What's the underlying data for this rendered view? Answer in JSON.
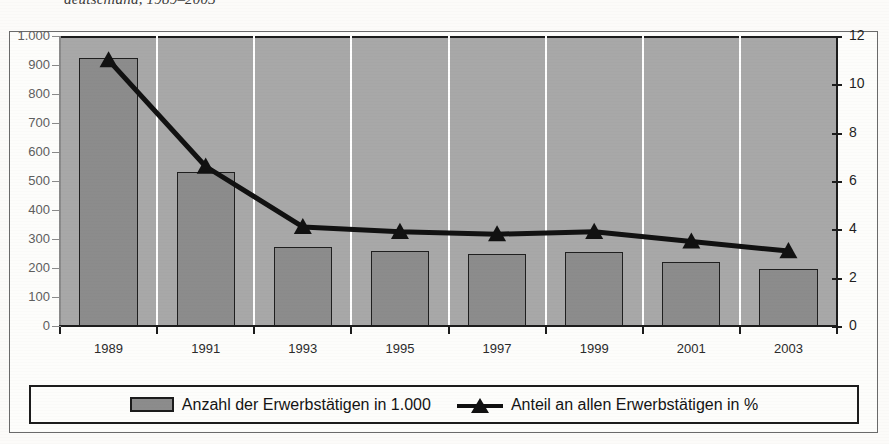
{
  "title": "deutschland, 1989–2003",
  "legend": {
    "bar_label": "Anzahl der Erwerbstätigen in 1.000",
    "bar_swatch_icon": "gray-bar-swatch",
    "line_label": "Anteil an allen Erwerbstätigen in %",
    "line_marker_icon": "triangle-marker-line"
  },
  "colors": {
    "plot_background": "#a8a8a8",
    "gridline": "#ffffff",
    "bar_fill": "#8c8c8c",
    "bar_border": "#1f1f1f",
    "line": "#111111",
    "axis": "#1c1c1c",
    "page_background": "#fcfbf9"
  },
  "chart_data": {
    "type": "bar",
    "title": "deutschland, 1989–2003",
    "subtitle": "",
    "xlabel": "",
    "ylabel": "",
    "grid": "vertical-white",
    "legend_position": "bottom",
    "categories": [
      "1989",
      "1991",
      "1993",
      "1995",
      "1997",
      "1999",
      "2001",
      "2003"
    ],
    "series": [
      {
        "name": "Anzahl der Erwerbstätigen in 1.000",
        "type": "bar",
        "axis": "left",
        "values": [
          925,
          530,
          272,
          258,
          250,
          255,
          222,
          198
        ]
      },
      {
        "name": "Anteil an allen Erwerbstätigen in %",
        "type": "line",
        "axis": "right",
        "values": [
          11.0,
          6.6,
          4.1,
          3.9,
          3.8,
          3.9,
          3.5,
          3.1
        ]
      }
    ],
    "left_axis": {
      "ylim": [
        0,
        1000
      ],
      "tick_step": 100,
      "tick_labels": [
        "0",
        "100",
        "200",
        "300",
        "400",
        "500",
        "600",
        "700",
        "800",
        "900",
        "1.000"
      ]
    },
    "right_axis": {
      "ylim": [
        0,
        12
      ],
      "tick_step": 2,
      "tick_labels": [
        "0",
        "2",
        "4",
        "6",
        "8",
        "10",
        "12"
      ]
    }
  }
}
